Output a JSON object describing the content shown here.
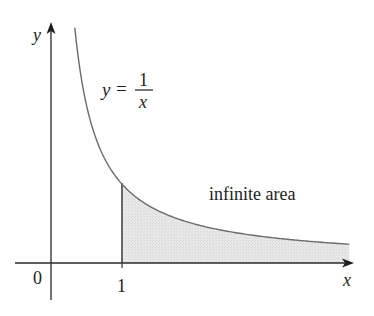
{
  "figure": {
    "function_label": {
      "lhs": "y",
      "equals": "=",
      "numerator": "1",
      "denominator": "x"
    },
    "region_label": "infinite area",
    "axes": {
      "x_label": "x",
      "y_label": "y",
      "origin_label": "0",
      "tick_labels": [
        "1"
      ]
    },
    "colors": {
      "axis": "#2a2a2a",
      "curve": "#6b6b6b",
      "boundary": "#333333",
      "shade": "#e4e4e4",
      "background": "#ffffff"
    }
  },
  "chart_data": {
    "type": "area",
    "title": "",
    "function": "y = 1/x",
    "xlabel": "x",
    "ylabel": "y",
    "x_ticks": [
      "0",
      "1"
    ],
    "curve_domain": [
      0.33,
      4.26
    ],
    "shaded_region": {
      "from_x": 1,
      "to_x": "infinity (drawn to ~4.26)",
      "label": "infinite area"
    },
    "grid": false,
    "legend": "none"
  }
}
